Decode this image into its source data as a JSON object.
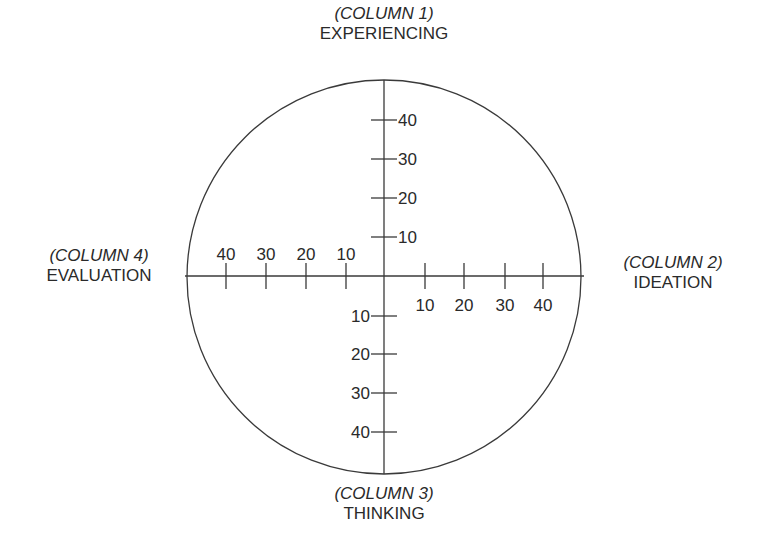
{
  "diagram": {
    "title": "",
    "center": {
      "x": 384,
      "y": 276
    },
    "radius": 198,
    "stroke_color": "#333333",
    "tick_values": [
      10,
      20,
      30,
      40
    ],
    "axes": {
      "top": {
        "column": "(COLUMN 1)",
        "name": "EXPERIENCING"
      },
      "right": {
        "column": "(COLUMN 2)",
        "name": "IDEATION"
      },
      "bottom": {
        "column": "(COLUMN 3)",
        "name": "THINKING"
      },
      "left": {
        "column": "(COLUMN 4)",
        "name": "EVALUATION"
      }
    },
    "ticks": {
      "up": [
        {
          "label": "10",
          "pos": 237
        },
        {
          "label": "20",
          "pos": 198
        },
        {
          "label": "30",
          "pos": 159
        },
        {
          "label": "40",
          "pos": 120
        }
      ],
      "right": [
        {
          "label": "10",
          "pos": 425
        },
        {
          "label": "20",
          "pos": 464
        },
        {
          "label": "30",
          "pos": 505
        },
        {
          "label": "40",
          "pos": 543
        }
      ],
      "down": [
        {
          "label": "10",
          "pos": 316
        },
        {
          "label": "20",
          "pos": 354
        },
        {
          "label": "30",
          "pos": 393
        },
        {
          "label": "40",
          "pos": 432
        }
      ],
      "left": [
        {
          "label": "10",
          "pos": 346
        },
        {
          "label": "20",
          "pos": 306
        },
        {
          "label": "30",
          "pos": 266
        },
        {
          "label": "40",
          "pos": 226
        }
      ]
    }
  }
}
